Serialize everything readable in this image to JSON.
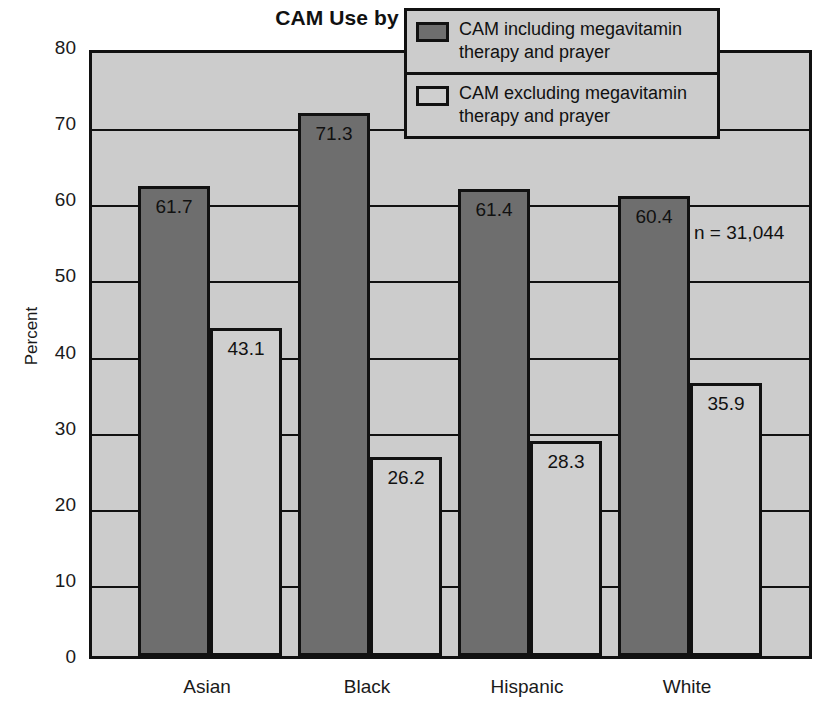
{
  "chart_data": {
    "type": "bar",
    "title": "CAM Use by Race/Ethnicity",
    "xlabel": "",
    "ylabel": "Percent",
    "ylim": [
      0,
      80
    ],
    "ytick_step": 10,
    "yticks": [
      "80",
      "70",
      "60",
      "50",
      "40",
      "30",
      "20",
      "10",
      "0"
    ],
    "grid": true,
    "legend_position": "top-right",
    "categories": [
      "Asian",
      "Black",
      "Hispanic",
      "White"
    ],
    "series": [
      {
        "name": "CAM including megavitamin therapy and prayer",
        "color": "#6e6e6e",
        "values": [
          61.7,
          71.3,
          61.4,
          60.4
        ]
      },
      {
        "name": "CAM excluding megavitamin therapy and prayer",
        "color": "#cfcfcf",
        "values": [
          43.1,
          26.2,
          28.3,
          35.9
        ]
      }
    ],
    "annotations": [
      "n = 31,044"
    ]
  },
  "legend": {
    "entries": [
      {
        "label": "CAM including megavitamin therapy and prayer",
        "swatch": "dark"
      },
      {
        "label": "CAM excluding megavitamin therapy and prayer",
        "swatch": "light"
      }
    ]
  },
  "annotation": {
    "sample_size": "n = 31,044"
  },
  "colors": {
    "series_dark": "#6e6e6e",
    "series_light": "#cfcfcf",
    "plot_background": "#cccccc",
    "axis": "#111111"
  }
}
